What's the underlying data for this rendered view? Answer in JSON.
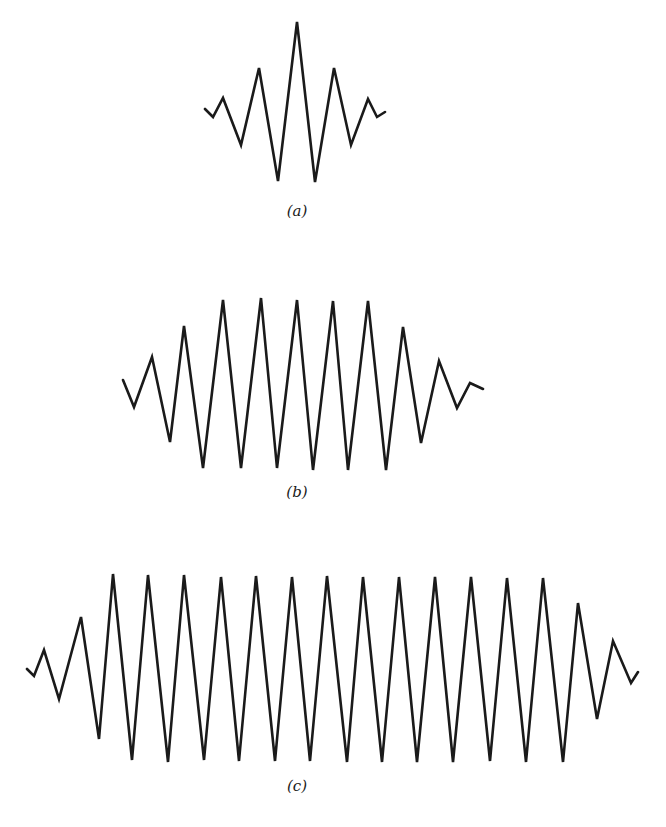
{
  "figure": {
    "panels": [
      {
        "label": "(a)",
        "label_pos": [
          297,
          202
        ],
        "stroke": "#1a1a1a",
        "points": [
          [
            205,
            109
          ],
          [
            213,
            117
          ],
          [
            223,
            98
          ],
          [
            241,
            145
          ],
          [
            259,
            68
          ],
          [
            278,
            181
          ],
          [
            297,
            22
          ],
          [
            315,
            182
          ],
          [
            334,
            68
          ],
          [
            351,
            145
          ],
          [
            368,
            99
          ],
          [
            377,
            117
          ],
          [
            385,
            112
          ]
        ]
      },
      {
        "label": "(b)",
        "label_pos": [
          297,
          483
        ],
        "stroke": "#1a1a1a",
        "points": [
          [
            123,
            380
          ],
          [
            134,
            407
          ],
          [
            152,
            357
          ],
          [
            170,
            442
          ],
          [
            184,
            326
          ],
          [
            203,
            468
          ],
          [
            223,
            300
          ],
          [
            241,
            468
          ],
          [
            261,
            298
          ],
          [
            277,
            468
          ],
          [
            297,
            300
          ],
          [
            313,
            470
          ],
          [
            333,
            301
          ],
          [
            348,
            470
          ],
          [
            368,
            301
          ],
          [
            386,
            470
          ],
          [
            403,
            327
          ],
          [
            421,
            443
          ],
          [
            439,
            361
          ],
          [
            457,
            408
          ],
          [
            470,
            383
          ],
          [
            483,
            389
          ]
        ]
      },
      {
        "label": "(c)",
        "label_pos": [
          297,
          777
        ],
        "stroke": "#1a1a1a",
        "points": [
          [
            27,
            669
          ],
          [
            34,
            676
          ],
          [
            44,
            650
          ],
          [
            59,
            699
          ],
          [
            81,
            617
          ],
          [
            99,
            739
          ],
          [
            113,
            574
          ],
          [
            132,
            760
          ],
          [
            148,
            575
          ],
          [
            168,
            762
          ],
          [
            184,
            575
          ],
          [
            204,
            760
          ],
          [
            221,
            577
          ],
          [
            239,
            761
          ],
          [
            256,
            576
          ],
          [
            275,
            761
          ],
          [
            292,
            577
          ],
          [
            310,
            761
          ],
          [
            327,
            576
          ],
          [
            347,
            762
          ],
          [
            363,
            577
          ],
          [
            382,
            762
          ],
          [
            399,
            577
          ],
          [
            417,
            762
          ],
          [
            435,
            577
          ],
          [
            453,
            762
          ],
          [
            471,
            577
          ],
          [
            490,
            761
          ],
          [
            507,
            578
          ],
          [
            526,
            762
          ],
          [
            543,
            578
          ],
          [
            563,
            762
          ],
          [
            578,
            603
          ],
          [
            597,
            719
          ],
          [
            613,
            641
          ],
          [
            631,
            683
          ],
          [
            638,
            672
          ]
        ]
      }
    ]
  }
}
